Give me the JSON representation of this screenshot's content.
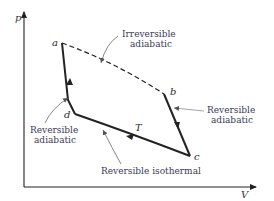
{
  "diagram": {
    "type": "p-V cycle diagram",
    "axes": {
      "y_label": "p",
      "x_label": "V"
    },
    "points": [
      {
        "id": "a",
        "label": "a"
      },
      {
        "id": "b",
        "label": "b"
      },
      {
        "id": "c",
        "label": "c"
      },
      {
        "id": "d",
        "label": "d"
      }
    ],
    "paths": [
      {
        "from": "a",
        "to": "b",
        "style": "dashed",
        "annotation": "Irreversible adiabatic"
      },
      {
        "from": "b",
        "to": "c",
        "style": "solid",
        "annotation": "Reversible adiabatic"
      },
      {
        "from": "c",
        "to": "d",
        "style": "solid",
        "annotation": "Reversible isothermal",
        "curve_label": "T"
      },
      {
        "from": "d",
        "to": "a",
        "style": "solid",
        "annotation": "Reversible adiabatic"
      }
    ],
    "annotations": {
      "irreversible_adiabatic": [
        "Irreversible",
        "adiabatic"
      ],
      "reversible_adiabatic_right": [
        "Reversible",
        "adiabatic"
      ],
      "reversible_adiabatic_left": [
        "Reversible",
        "adiabatic"
      ],
      "reversible_isothermal": "Reversible isothermal",
      "isotherm_label": "T"
    }
  }
}
